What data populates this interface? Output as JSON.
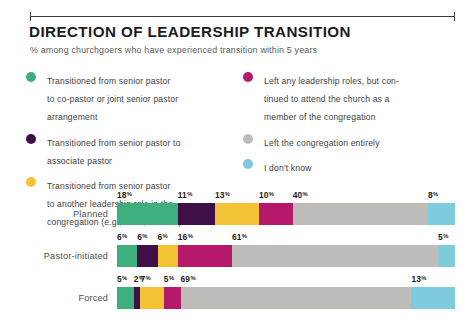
{
  "header": {
    "title": "DIRECTION OF LEADERSHIP TRANSITION",
    "subtitle": "% among churchgoers who have experienced transition within 5 years"
  },
  "legend": {
    "left_items": [
      {
        "label": "Transitioned from senior pastor\nto co-pastor or joint senior pastor\narrangement",
        "color": "#3DAE7C",
        "key": "co_pastor"
      },
      {
        "label": "Transitioned from senior pastor to\nassociate pastor",
        "color": "#3F1048",
        "key": "associate_pastor"
      },
      {
        "label": "Transitioned from senior pastor\nto another leadership role in the\ncongregation (e.g., elder, teacher)",
        "color": "#F2C335",
        "key": "other_leadership"
      }
    ],
    "right_items": [
      {
        "label": "Left any leadership roles, but con-\ntinued to attend the church as a\nmember of the congregation",
        "color": "#B5196B",
        "key": "left_roles_stayed"
      },
      {
        "label": "Left the congregation entirely",
        "color": "#BDBCB8",
        "key": "left_congregation"
      },
      {
        "label": "I don't know",
        "color": "#7FCBDE",
        "key": "dont_know"
      }
    ]
  },
  "chart_data": {
    "type": "bar",
    "subtype": "stacked-horizontal-100",
    "title": "DIRECTION OF LEADERSHIP TRANSITION",
    "subtitle": "% among churchgoers who have experienced transition within 5 years",
    "xlabel": "",
    "ylabel": "",
    "xlim": [
      0,
      100
    ],
    "grid": false,
    "legend_position": "top",
    "value_suffix": "%",
    "categories": [
      "Planned",
      "Pastor-initiated",
      "Forced"
    ],
    "series": [
      {
        "name": "Transitioned from senior pastor to co-pastor or joint senior pastor arrangement",
        "color": "#3DAE7C",
        "values": [
          18,
          6,
          5
        ]
      },
      {
        "name": "Transitioned from senior pastor to associate pastor",
        "color": "#3F1048",
        "values": [
          11,
          6,
          2
        ]
      },
      {
        "name": "Transitioned from senior pastor to another leadership role in the congregation (e.g., elder, teacher)",
        "color": "#F2C335",
        "values": [
          13,
          6,
          7
        ]
      },
      {
        "name": "Left any leadership roles, but continued to attend the church as a member of the congregation",
        "color": "#B5196B",
        "values": [
          10,
          16,
          5
        ]
      },
      {
        "name": "Left the congregation entirely",
        "color": "#BDBCB8",
        "values": [
          40,
          61,
          69
        ]
      },
      {
        "name": "I don't know",
        "color": "#7FCBDE",
        "values": [
          8,
          5,
          13
        ]
      }
    ],
    "rows": [
      {
        "label": "Planned",
        "segments": [
          {
            "value": 18,
            "label": "18",
            "color": "#3DAE7C"
          },
          {
            "value": 11,
            "label": "11",
            "color": "#3F1048"
          },
          {
            "value": 13,
            "label": "13",
            "color": "#F2C335"
          },
          {
            "value": 10,
            "label": "10",
            "color": "#B5196B"
          },
          {
            "value": 40,
            "label": "40",
            "color": "#BDBCB8"
          },
          {
            "value": 8,
            "label": "8",
            "color": "#7FCBDE"
          }
        ]
      },
      {
        "label": "Pastor-initiated",
        "segments": [
          {
            "value": 6,
            "label": "6",
            "color": "#3DAE7C"
          },
          {
            "value": 6,
            "label": "6",
            "color": "#3F1048"
          },
          {
            "value": 6,
            "label": "6",
            "color": "#F2C335"
          },
          {
            "value": 16,
            "label": "16",
            "color": "#B5196B"
          },
          {
            "value": 61,
            "label": "61",
            "color": "#BDBCB8"
          },
          {
            "value": 5,
            "label": "5",
            "color": "#7FCBDE"
          }
        ]
      },
      {
        "label": "Forced",
        "segments": [
          {
            "value": 5,
            "label": "5",
            "color": "#3DAE7C"
          },
          {
            "value": 2,
            "label": "2",
            "color": "#3F1048"
          },
          {
            "value": 7,
            "label": "7",
            "color": "#F2C335"
          },
          {
            "value": 5,
            "label": "5",
            "color": "#B5196B"
          },
          {
            "value": 69,
            "label": "69",
            "color": "#BDBCB8"
          },
          {
            "value": 13,
            "label": "13",
            "color": "#7FCBDE"
          }
        ]
      }
    ]
  },
  "style": {
    "percent_symbol": "%",
    "rule_color": "#3a3a3a",
    "label_color": "#4d4d4d"
  }
}
